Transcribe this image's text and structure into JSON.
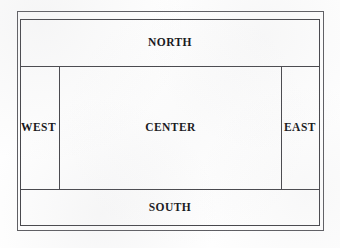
{
  "diagram": {
    "background_color": "#fefefe",
    "border_color": "#46464b",
    "outer_frame_color": "#5d5d62",
    "text_color": "#141418",
    "regions": [
      {
        "key": "north",
        "label": "NORTH"
      },
      {
        "key": "west",
        "label": "WEST"
      },
      {
        "key": "center",
        "label": "CENTER"
      },
      {
        "key": "east",
        "label": "EAST"
      },
      {
        "key": "south",
        "label": "SOUTH"
      }
    ]
  }
}
